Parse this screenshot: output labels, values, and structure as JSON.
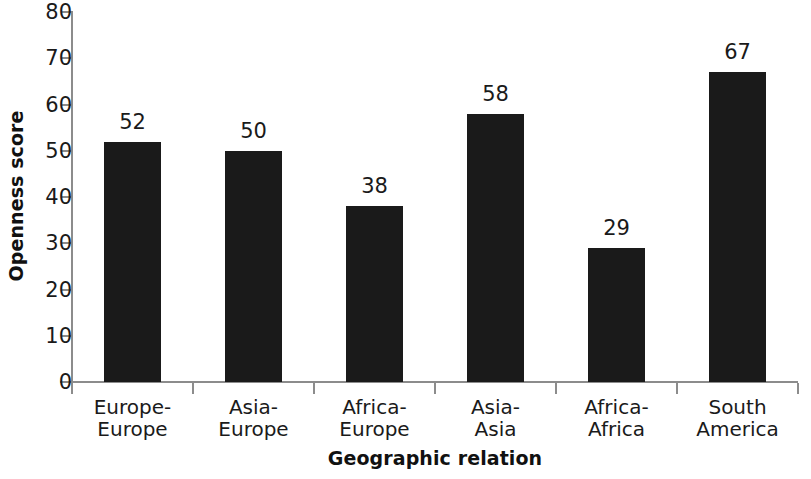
{
  "chart_data": {
    "type": "bar",
    "title": "",
    "subtitle": "",
    "xlabel": "Geographic relation",
    "ylabel": "Openness score",
    "categories": [
      "Europe-\nEurope",
      "Asia-\nEurope",
      "Africa-\nEurope",
      "Asia-\nAsia",
      "Africa-\nAfrica",
      "South\nAmerica"
    ],
    "values": [
      52,
      50,
      38,
      58,
      29,
      67
    ],
    "value_labels": [
      "52",
      "50",
      "38",
      "58",
      "29",
      "67"
    ],
    "ylim": [
      0,
      80
    ],
    "ytick_labels": [
      "0",
      "10",
      "20",
      "30",
      "40",
      "50",
      "60",
      "70",
      "80"
    ],
    "ytick_values": [
      0,
      10,
      20,
      30,
      40,
      50,
      60,
      70,
      80
    ],
    "grid": false,
    "legend": null,
    "bar_color": "#1a1a1a",
    "axis_color": "#8c8c8c",
    "background_color": "#ffffff",
    "text_color": "#1a1a1a"
  }
}
